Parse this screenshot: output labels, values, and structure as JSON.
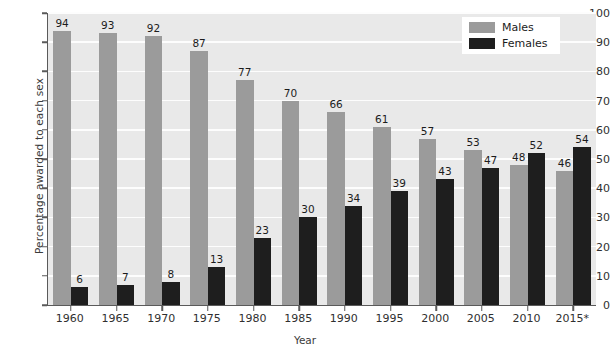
{
  "chart_data": {
    "type": "bar",
    "title": "",
    "xlabel": "Year",
    "ylabel": "Percentage awarded to each sex",
    "categories": [
      "1960",
      "1965",
      "1970",
      "1975",
      "1980",
      "1985",
      "1990",
      "1995",
      "2000",
      "2005",
      "2010",
      "2015*"
    ],
    "series": [
      {
        "name": "Males",
        "color": "#9b9b9b",
        "values": [
          94,
          93,
          92,
          87,
          77,
          70,
          66,
          61,
          57,
          53,
          48,
          46
        ]
      },
      {
        "name": "Females",
        "color": "#1e1e1e",
        "values": [
          6,
          7,
          8,
          13,
          23,
          30,
          34,
          39,
          43,
          47,
          52,
          54
        ]
      }
    ],
    "ylim": [
      0,
      100
    ],
    "yticks": [
      0,
      10,
      20,
      30,
      40,
      50,
      60,
      70,
      80,
      90,
      100
    ],
    "ytick_labels": [
      "0",
      "10",
      "20",
      "30",
      "40",
      "50",
      "60",
      "70",
      "80",
      "90",
      "100"
    ],
    "grid": true,
    "grid_color": "#fdfdfd",
    "plot_background": "#e9e9e9",
    "legend_position": "top-right",
    "data_labels": true
  },
  "legend": {
    "entries": [
      {
        "label": "Males",
        "swatch": "male"
      },
      {
        "label": "Females",
        "swatch": "female"
      }
    ]
  }
}
